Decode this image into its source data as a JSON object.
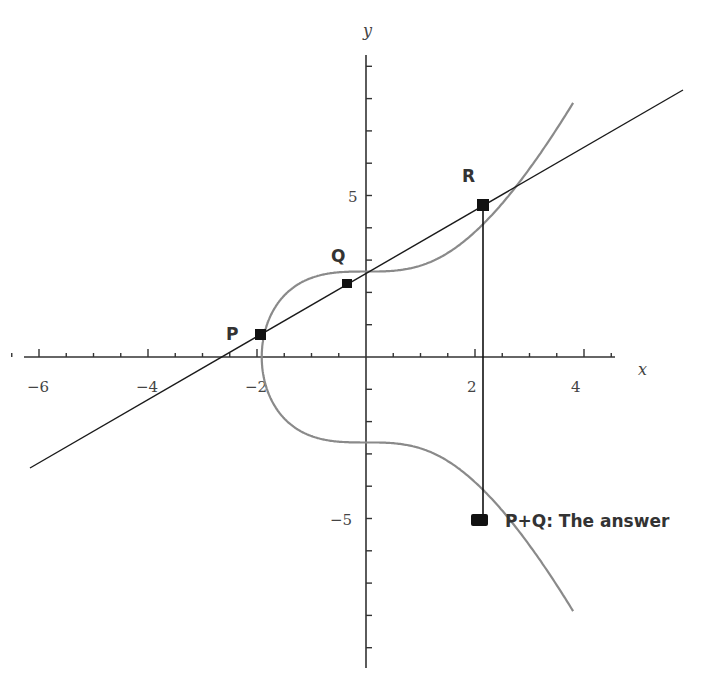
{
  "chart_data": {
    "type": "line",
    "title": "",
    "xlabel": "x",
    "ylabel": "y",
    "xlim": [
      -6.5,
      4.8
    ],
    "ylim": [
      -9.5,
      9.5
    ],
    "x_tick_labels": [
      "-6",
      "-4",
      "-2",
      "2",
      "4"
    ],
    "x_ticks_major": [
      -6,
      -4,
      -2,
      2,
      4
    ],
    "y_tick_labels": [
      "5",
      "-5"
    ],
    "y_ticks_major": [
      5,
      -5
    ],
    "curve": {
      "equation": "y^2 = x^3 + 7",
      "color": "#8a8a8a"
    },
    "secant_line": {
      "color": "#1a1a1a",
      "through": [
        "P",
        "Q",
        "R"
      ]
    },
    "points": [
      {
        "name": "P",
        "x": -1.9,
        "y": 0.7
      },
      {
        "name": "Q",
        "x": -0.3,
        "y": 2.3
      },
      {
        "name": "R",
        "x": 2.2,
        "y": 4.7
      },
      {
        "name": "P+Q",
        "x": 2.2,
        "y": -4.7
      }
    ],
    "annotations": [
      "P",
      "Q",
      "R",
      "P+Q: The answer"
    ]
  },
  "labels": {
    "x_axis": "x",
    "y_axis": "y",
    "x_ticks": {
      "m6": "−6",
      "m4": "−4",
      "m2": "−2",
      "p2": "2",
      "p4": "4"
    },
    "y_ticks": {
      "p5": "5",
      "m5": "−5"
    },
    "point_p": "P",
    "point_q": "Q",
    "point_r": "R",
    "answer": "P+Q: The answer"
  }
}
